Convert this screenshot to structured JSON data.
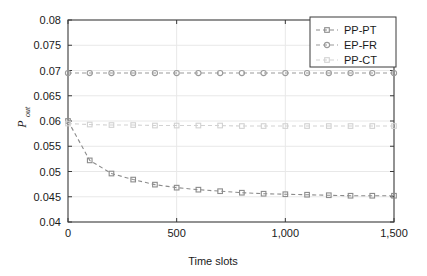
{
  "chart_data": {
    "type": "line",
    "title": "",
    "xlabel": "Time slots",
    "ylabel": "P_out",
    "ylabel_main": "P",
    "ylabel_sub": "out",
    "xlim": [
      0,
      1500
    ],
    "ylim": [
      0.04,
      0.08
    ],
    "grid": true,
    "legend_position": "top-right",
    "xticks": [
      0,
      500,
      1000,
      1500
    ],
    "xticklabels": [
      "0",
      "500",
      "1,000",
      "1,500"
    ],
    "yticks": [
      0.04,
      0.045,
      0.05,
      0.055,
      0.06,
      0.065,
      0.07,
      0.075,
      0.08
    ],
    "yticklabels": [
      "0.04",
      "0.045",
      "0.05",
      "0.055",
      "0.06",
      "0.065",
      "0.07",
      "0.075",
      "0.08"
    ],
    "series": [
      {
        "name": "PP-PT",
        "marker": "square",
        "linestyle": "dashed",
        "color": "#8c8c8c",
        "x": [
          0,
          100,
          200,
          300,
          400,
          500,
          600,
          700,
          800,
          900,
          1000,
          1100,
          1200,
          1300,
          1400,
          1500
        ],
        "values": [
          0.06,
          0.0522,
          0.0496,
          0.0484,
          0.0474,
          0.0468,
          0.0464,
          0.0461,
          0.0458,
          0.0456,
          0.0455,
          0.0454,
          0.0453,
          0.0452,
          0.0452,
          0.0452
        ]
      },
      {
        "name": "EP-FR",
        "marker": "circle",
        "linestyle": "dashed",
        "color": "#9a9a9a",
        "x": [
          0,
          100,
          200,
          300,
          400,
          500,
          600,
          700,
          800,
          900,
          1000,
          1100,
          1200,
          1300,
          1400,
          1500
        ],
        "values": [
          0.0695,
          0.0695,
          0.0695,
          0.0695,
          0.0695,
          0.0695,
          0.0695,
          0.0695,
          0.0695,
          0.0695,
          0.0695,
          0.0695,
          0.0695,
          0.0695,
          0.0695,
          0.0695
        ]
      },
      {
        "name": "PP-CT",
        "marker": "square",
        "linestyle": "dashed",
        "color": "#d2d2d2",
        "x": [
          0,
          100,
          200,
          300,
          400,
          500,
          600,
          700,
          800,
          900,
          1000,
          1100,
          1200,
          1300,
          1400,
          1500
        ],
        "values": [
          0.0595,
          0.0593,
          0.0592,
          0.0592,
          0.0591,
          0.0591,
          0.0591,
          0.0591,
          0.059,
          0.059,
          0.059,
          0.059,
          0.059,
          0.059,
          0.059,
          0.059
        ]
      }
    ]
  },
  "legend": {
    "items": [
      {
        "label": "PP-PT"
      },
      {
        "label": "EP-FR"
      },
      {
        "label": "PP-CT"
      }
    ]
  },
  "colors": {
    "axis": "#3a3a3a",
    "grid": "#e8e8e8",
    "background": "#ffffff",
    "series_pp_pt": "#8c8c8c",
    "series_ep_fr": "#9a9a9a",
    "series_pp_ct": "#d2d2d2"
  }
}
